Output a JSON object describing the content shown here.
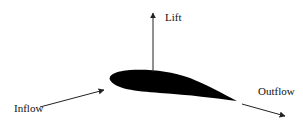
{
  "diagram": {
    "labels": {
      "lift": "Lift",
      "inflow": "Inflow",
      "outflow": "Outflow"
    },
    "colors": {
      "airfoil": "#000000",
      "arrow": "#222222",
      "text": "#111111",
      "background": "#ffffff"
    }
  }
}
